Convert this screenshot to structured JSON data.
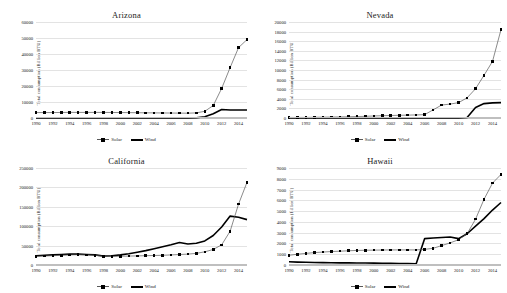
{
  "figure": {
    "ylabel": "Total consumption (Billion BTU)",
    "legend": {
      "solar": "Solar",
      "wind": "Wind"
    },
    "colors": {
      "solar_line": "#595959",
      "solar_marker": "#000000",
      "wind_line": "#000000",
      "gridline": "#e3e3e3"
    }
  },
  "chart_data": [
    {
      "type": "line",
      "title": "Arizona",
      "xlabel": "",
      "ylabel": "Total consumption (Billion BTU)",
      "legend_position": "bottom",
      "grid": true,
      "x": [
        1990,
        1991,
        1992,
        1993,
        1994,
        1995,
        1996,
        1997,
        1998,
        1999,
        2000,
        2001,
        2002,
        2003,
        2004,
        2005,
        2006,
        2007,
        2008,
        2009,
        2010,
        2011,
        2012,
        2013,
        2014,
        2015
      ],
      "xticklabels": [
        "1990",
        "1992",
        "1994",
        "1996",
        "1998",
        "2000",
        "2002",
        "2004",
        "2006",
        "2008",
        "2010",
        "2012",
        "2014"
      ],
      "ylim": [
        0,
        60000
      ],
      "yticks": [
        0,
        10000,
        20000,
        30000,
        40000,
        50000,
        60000
      ],
      "series": [
        {
          "name": "Solar",
          "values": [
            3400,
            3400,
            3400,
            3450,
            3500,
            3500,
            3500,
            3500,
            3500,
            3450,
            3400,
            3350,
            3300,
            3250,
            3200,
            3150,
            3100,
            3050,
            3000,
            3200,
            4200,
            7800,
            18500,
            31500,
            44000,
            49000
          ]
        },
        {
          "name": "Wind",
          "values": [
            0,
            0,
            0,
            0,
            0,
            0,
            0,
            0,
            0,
            0,
            0,
            0,
            0,
            0,
            0,
            0,
            0,
            0,
            0,
            150,
            800,
            2700,
            5300,
            5000,
            5000,
            5000
          ]
        }
      ]
    },
    {
      "type": "line",
      "title": "Nevada",
      "xlabel": "",
      "ylabel": "Total consumption (Billion BTU)",
      "legend_position": "bottom",
      "grid": true,
      "x": [
        1990,
        1991,
        1992,
        1993,
        1994,
        1995,
        1996,
        1997,
        1998,
        1999,
        2000,
        2001,
        2002,
        2003,
        2004,
        2005,
        2006,
        2007,
        2008,
        2009,
        2010,
        2011,
        2012,
        2013,
        2014,
        2015
      ],
      "xticklabels": [
        "1990",
        "1992",
        "1994",
        "1996",
        "1998",
        "2000",
        "2002",
        "2004",
        "2006",
        "2008",
        "2010",
        "2012",
        "2014"
      ],
      "ylim": [
        0,
        20000
      ],
      "yticks": [
        0,
        2000,
        4000,
        6000,
        8000,
        10000,
        12000,
        14000,
        16000,
        18000,
        20000
      ],
      "series": [
        {
          "name": "Solar",
          "values": [
            120,
            120,
            130,
            150,
            180,
            200,
            230,
            260,
            300,
            350,
            420,
            480,
            520,
            560,
            600,
            640,
            700,
            1700,
            2700,
            2900,
            3200,
            4200,
            6100,
            8900,
            11800,
            18400
          ]
        },
        {
          "name": "Wind",
          "values": [
            0,
            0,
            0,
            0,
            0,
            0,
            0,
            0,
            0,
            0,
            0,
            0,
            0,
            0,
            0,
            0,
            0,
            0,
            0,
            0,
            0,
            100,
            2200,
            3000,
            3150,
            3200
          ]
        }
      ]
    },
    {
      "type": "line",
      "title": "California",
      "xlabel": "",
      "ylabel": "Total consumption (Billion BTU)",
      "legend_position": "bottom",
      "grid": true,
      "x": [
        1990,
        1991,
        1992,
        1993,
        1994,
        1995,
        1996,
        1997,
        1998,
        1999,
        2000,
        2001,
        2002,
        2003,
        2004,
        2005,
        2006,
        2007,
        2008,
        2009,
        2010,
        2011,
        2012,
        2013,
        2014,
        2015
      ],
      "xticklabels": [
        "1990",
        "1992",
        "1994",
        "1996",
        "1998",
        "2000",
        "2002",
        "2004",
        "2006",
        "2008",
        "2010",
        "2012",
        "2014"
      ],
      "ylim": [
        0,
        250000
      ],
      "yticks": [
        0,
        50000,
        100000,
        150000,
        200000,
        250000
      ],
      "series": [
        {
          "name": "Solar",
          "values": [
            22000,
            23000,
            24000,
            25000,
            26000,
            26500,
            26000,
            25000,
            22000,
            22000,
            22500,
            23000,
            23500,
            24000,
            24500,
            25000,
            26000,
            27000,
            28000,
            30000,
            34000,
            40000,
            52000,
            87000,
            157000,
            213000
          ]
        },
        {
          "name": "Wind",
          "values": [
            24000,
            25000,
            26000,
            27000,
            28000,
            28000,
            27000,
            26000,
            23000,
            24000,
            26000,
            29000,
            33000,
            37000,
            42000,
            47000,
            52000,
            58000,
            54000,
            56000,
            62000,
            76000,
            98000,
            126000,
            123000,
            117000
          ]
        }
      ]
    },
    {
      "type": "line",
      "title": "Hawaii",
      "xlabel": "",
      "ylabel": "Total consumption (Billion BTU)",
      "legend_position": "bottom",
      "grid": true,
      "x": [
        1990,
        1991,
        1992,
        1993,
        1994,
        1995,
        1996,
        1997,
        1998,
        1999,
        2000,
        2001,
        2002,
        2003,
        2004,
        2005,
        2006,
        2007,
        2008,
        2009,
        2010,
        2011,
        2012,
        2013,
        2014,
        2015
      ],
      "xticklabels": [
        "1990",
        "1992",
        "1994",
        "1996",
        "1998",
        "2000",
        "2002",
        "2004",
        "2006",
        "2008",
        "2010",
        "2012",
        "2014"
      ],
      "ylim": [
        0,
        9000
      ],
      "yticks": [
        0,
        1000,
        2000,
        3000,
        4000,
        5000,
        6000,
        7000,
        8000,
        9000
      ],
      "series": [
        {
          "name": "Solar",
          "values": [
            900,
            1000,
            1080,
            1150,
            1200,
            1250,
            1280,
            1320,
            1350,
            1370,
            1380,
            1390,
            1400,
            1400,
            1400,
            1400,
            1450,
            1550,
            1800,
            2050,
            2350,
            2900,
            4250,
            6100,
            7600,
            8400
          ]
        },
        {
          "name": "Wind",
          "values": [
            300,
            270,
            250,
            230,
            220,
            210,
            200,
            195,
            190,
            180,
            170,
            160,
            150,
            140,
            130,
            120,
            2450,
            2500,
            2550,
            2600,
            2450,
            2900,
            3600,
            4300,
            5100,
            5800
          ]
        }
      ]
    }
  ]
}
